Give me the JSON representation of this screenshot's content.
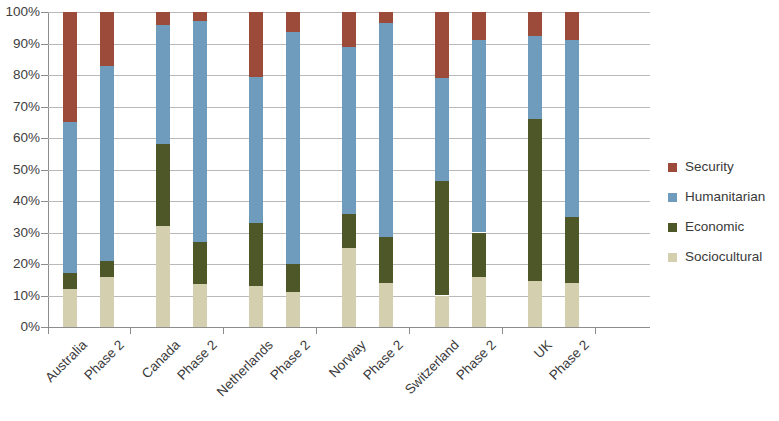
{
  "chart_data": {
    "type": "bar",
    "subtype": "stacked-bar-100-percent",
    "title": "",
    "xlabel": "",
    "ylabel": "",
    "ylim": [
      0,
      100
    ],
    "ytick_labels": [
      "100%",
      "90%",
      "80%",
      "70%",
      "60%",
      "50%",
      "40%",
      "30%",
      "20%",
      "10%",
      "0%"
    ],
    "ytick_values": [
      100,
      90,
      80,
      70,
      60,
      50,
      40,
      30,
      20,
      10,
      0
    ],
    "grid": true,
    "legend_position": "right",
    "groups": [
      "Australia",
      "Canada",
      "Netherlands",
      "Norway",
      "Switzerland",
      "UK"
    ],
    "categories": [
      "Australia",
      "Phase 2",
      "Canada",
      "Phase 2",
      "Netherlands",
      "Phase 2",
      "Norway",
      "Phase 2",
      "Switzerland",
      "Phase 2",
      "UK",
      "Phase 2"
    ],
    "series": [
      {
        "name": "Sociocultural",
        "color": "#d4cfae",
        "values": [
          12,
          16,
          32,
          13.5,
          13,
          11,
          25,
          14,
          10,
          16,
          14.5,
          14
        ]
      },
      {
        "name": "Economic",
        "color": "#4d5727",
        "values": [
          5,
          5,
          26,
          13.5,
          20,
          9,
          11,
          14.5,
          36.5,
          14,
          51.5,
          21
        ]
      },
      {
        "name": "Humanitarian",
        "color": "#6f9bbd",
        "values": [
          48,
          62,
          38,
          70,
          46.5,
          73.5,
          53,
          68,
          32.5,
          61,
          26.5,
          56
        ]
      },
      {
        "name": "Security",
        "color": "#9c4a39",
        "values": [
          35,
          17,
          4,
          3,
          20.5,
          6.5,
          11,
          3.5,
          21,
          9,
          7.5,
          9
        ]
      }
    ],
    "cumulative_tops": {
      "Australia": [
        12,
        17,
        65,
        100
      ],
      "Australia Phase 2": [
        16,
        21,
        83,
        100
      ],
      "Canada": [
        32,
        58,
        96,
        100
      ],
      "Canada Phase 2": [
        13.5,
        27,
        97,
        100
      ],
      "Netherlands": [
        13,
        33,
        79.5,
        100
      ],
      "Netherlands Phase 2": [
        11,
        20,
        93.5,
        100
      ],
      "Norway": [
        25,
        36,
        89,
        100
      ],
      "Norway Phase 2": [
        14,
        28.5,
        96.5,
        100
      ],
      "Switzerland": [
        10,
        46.5,
        79,
        100
      ],
      "Switzerland Phase 2": [
        16,
        30,
        91,
        100
      ],
      "UK": [
        14.5,
        66,
        92.5,
        100
      ],
      "UK Phase 2": [
        14,
        35,
        91,
        100
      ]
    }
  },
  "legend": {
    "items": [
      {
        "label": "Security",
        "color": "#9c4a39"
      },
      {
        "label": "Humanitarian",
        "color": "#6f9bbd"
      },
      {
        "label": "Economic",
        "color": "#4d5727"
      },
      {
        "label": "Sociocultural",
        "color": "#d4cfae"
      }
    ]
  },
  "colors": {
    "security": "#9c4a39",
    "humanitarian": "#6f9bbd",
    "economic": "#4d5727",
    "sociocultural": "#d4cfae",
    "gridline": "#b9b9b9",
    "axis": "#8d8d8d",
    "text": "#3a3a3a",
    "background": "#ffffff"
  }
}
